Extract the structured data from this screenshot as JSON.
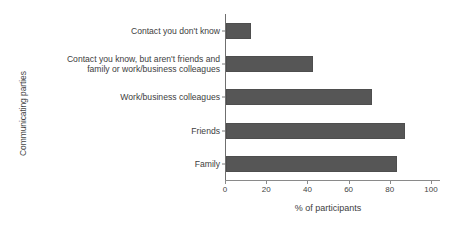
{
  "chart_data": {
    "type": "bar",
    "orientation": "horizontal",
    "title": "",
    "xlabel": "% of participants",
    "ylabel": "Communicating parties",
    "categories": [
      "Contact you don't know",
      "Contact you know, but aren't friends and\nfamily or work/business colleagues",
      "Work/business colleagues",
      "Friends",
      "Family"
    ],
    "values": [
      12,
      42,
      71,
      87,
      83
    ],
    "xlim": [
      0,
      100
    ],
    "xticks": [
      0,
      20,
      40,
      60,
      80,
      100
    ],
    "xtick_labels": [
      "0",
      "20",
      "40",
      "60",
      "80",
      "100"
    ],
    "grid": false,
    "legend": null,
    "bar_color": "#565656",
    "axis_color": "#8a8a8a",
    "background": "#ffffff"
  }
}
